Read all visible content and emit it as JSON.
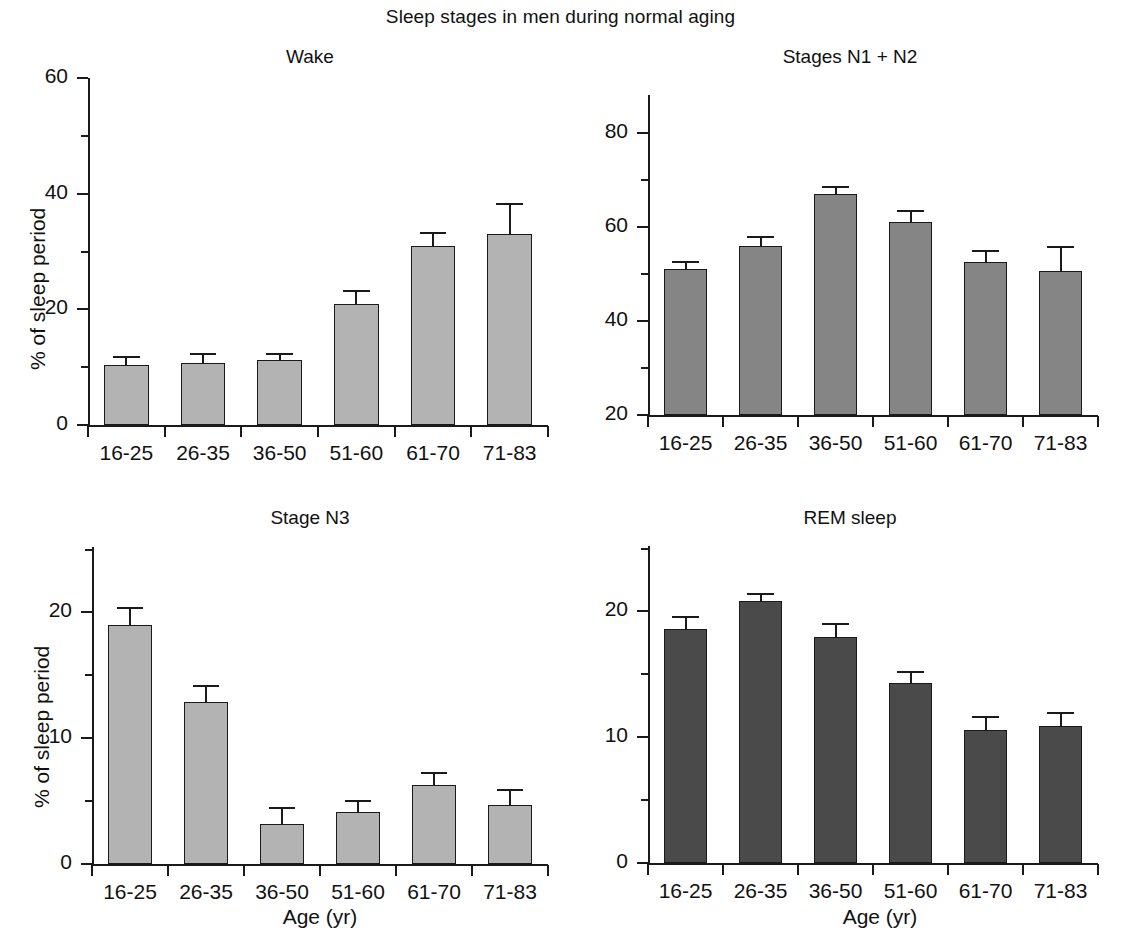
{
  "figure": {
    "title": "Sleep stages in men during normal aging",
    "ylabel": "% of sleep period",
    "xlabel": "Age (yr)",
    "bar_colors": {
      "wake": "#b3b3b3",
      "n1n2": "#858585",
      "n3": "#b3b3b3",
      "rem": "#4a4a4a"
    },
    "axis_color": "#1a1a1a",
    "background": "#ffffff"
  },
  "chart_data": [
    {
      "type": "bar",
      "title": "Wake",
      "panel": "top-left",
      "xlabel": "",
      "ylabel": "% of sleep period",
      "categories": [
        "16-25",
        "26-35",
        "36-50",
        "51-60",
        "61-70",
        "71-83"
      ],
      "values": [
        10.4,
        10.8,
        11.2,
        21.0,
        31.0,
        33.0
      ],
      "errors": [
        1.5,
        1.7,
        1.2,
        2.4,
        2.4,
        5.3
      ],
      "ylim": [
        0,
        60
      ],
      "yticks": [
        0,
        20,
        40,
        60
      ],
      "ytick_labels": [
        "0",
        "20",
        "40",
        "60"
      ],
      "grid": false,
      "legend": "none",
      "bar_color": "#b3b3b3"
    },
    {
      "type": "bar",
      "title": "Stages N1 + N2",
      "panel": "top-right",
      "xlabel": "",
      "ylabel": "",
      "categories": [
        "16-25",
        "26-35",
        "36-50",
        "51-60",
        "61-70",
        "71-83"
      ],
      "values": [
        51.0,
        56.0,
        67.0,
        61.0,
        52.5,
        50.7
      ],
      "errors": [
        1.8,
        2.0,
        1.6,
        2.5,
        2.5,
        5.2
      ],
      "ylim": [
        20,
        88
      ],
      "yticks": [
        20,
        40,
        60,
        80
      ],
      "ytick_labels": [
        "20",
        "40",
        "60",
        "80"
      ],
      "grid": false,
      "legend": "none",
      "bar_color": "#858585"
    },
    {
      "type": "bar",
      "title": "Stage N3",
      "panel": "bottom-left",
      "xlabel": "Age (yr)",
      "ylabel": "% of sleep period",
      "categories": [
        "16-25",
        "26-35",
        "36-50",
        "51-60",
        "61-70",
        "71-83"
      ],
      "values": [
        19.0,
        12.9,
        3.2,
        4.1,
        6.3,
        4.7
      ],
      "errors": [
        1.4,
        1.3,
        1.3,
        1.0,
        1.0,
        1.3
      ],
      "ylim": [
        0,
        25
      ],
      "yticks": [
        0,
        10,
        20
      ],
      "ytick_labels": [
        "0",
        "10",
        "20"
      ],
      "grid": false,
      "legend": "none",
      "bar_color": "#b3b3b3"
    },
    {
      "type": "bar",
      "title": "REM sleep",
      "panel": "bottom-right",
      "xlabel": "Age (yr)",
      "ylabel": "",
      "categories": [
        "16-25",
        "26-35",
        "36-50",
        "51-60",
        "61-70",
        "71-83"
      ],
      "values": [
        18.6,
        20.8,
        18.0,
        14.3,
        10.6,
        10.9
      ],
      "errors": [
        1.0,
        0.7,
        1.1,
        1.0,
        1.1,
        1.1
      ],
      "ylim": [
        0,
        25
      ],
      "yticks": [
        0,
        10,
        20
      ],
      "ytick_labels": [
        "0",
        "10",
        "20"
      ],
      "grid": false,
      "legend": "none",
      "bar_color": "#4a4a4a"
    }
  ]
}
